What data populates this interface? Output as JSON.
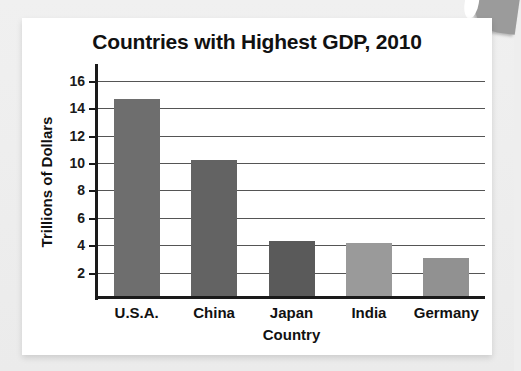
{
  "chart_data": {
    "type": "bar",
    "title": "Countries with Highest GDP, 2010",
    "xlabel": "Country",
    "ylabel": "Trillions of Dollars",
    "categories": [
      "U.S.A.",
      "China",
      "Japan",
      "India",
      "Germany"
    ],
    "values": [
      14.4,
      9.9,
      4.0,
      3.9,
      2.8
    ],
    "bar_colors": [
      "#6e6e6e",
      "#636363",
      "#5a5a5a",
      "#9a9a9a",
      "#919191"
    ],
    "ylim": [
      0,
      17
    ],
    "yticks": [
      2,
      4,
      6,
      8,
      10,
      12,
      14,
      16
    ],
    "ytick_labels": [
      "2",
      "4",
      "6",
      "8",
      "10",
      "12",
      "14",
      "16"
    ],
    "grid": true,
    "legend": false,
    "legend_position": "none"
  },
  "figure": {
    "background_color": "#ffffff",
    "page_background_color": "#eeeeee",
    "axis_color": "#1a1a1a",
    "gridline_color": "#555555",
    "corner_decoration": "page-corner-shape"
  }
}
